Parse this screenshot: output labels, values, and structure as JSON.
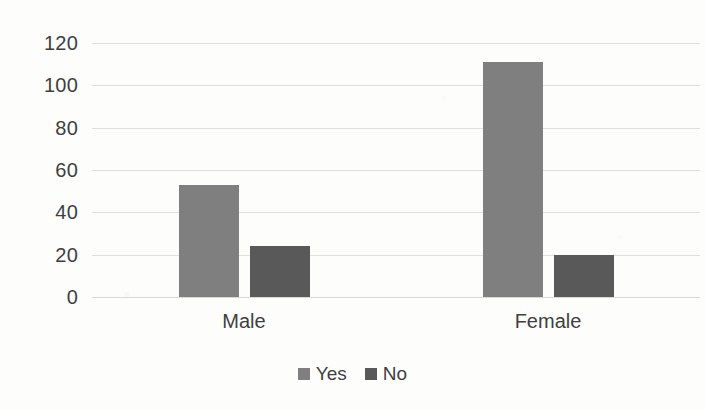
{
  "chart_data": {
    "type": "bar",
    "title": "",
    "subtitle": "",
    "xlabel": "",
    "ylabel": "",
    "categories": [
      "Male",
      "Female"
    ],
    "series": [
      {
        "name": "Yes",
        "color": "#7f7f7f",
        "values": [
          53,
          111
        ]
      },
      {
        "name": "No",
        "color": "#595959",
        "values": [
          24,
          20
        ]
      }
    ],
    "ylim": [
      0,
      120
    ],
    "ytick_values": [
      0,
      20,
      40,
      60,
      80,
      100,
      120
    ],
    "ytick_labels": [
      "0",
      "20",
      "40",
      "60",
      "80",
      "100",
      "120"
    ],
    "grid": true,
    "grid_axis": "y",
    "legend": {
      "position": "bottom",
      "entries": [
        "Yes",
        "No"
      ]
    },
    "background_color": "#fdfdfc",
    "gridline_color": "#e0e0dd",
    "text_color": "#3f3f3f"
  }
}
